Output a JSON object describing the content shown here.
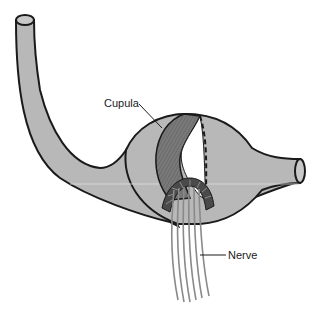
{
  "diagram": {
    "labels": {
      "cupula": "Cupula",
      "nerve": "Nerve"
    },
    "colors": {
      "canal_fill": "#b8b8b8",
      "outline": "#1a1a1a",
      "cupula_fill": "#7a7a7a",
      "hair_cells": "#4a4a4a",
      "nerve_fibers": "#8a8a8a",
      "background": "#ffffff"
    }
  }
}
